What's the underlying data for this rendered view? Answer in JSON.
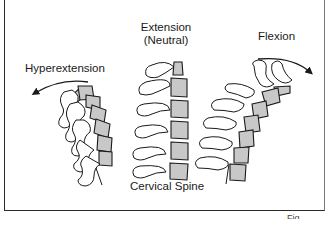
{
  "figure": {
    "title": "Cervical Spine",
    "panels": [
      {
        "id": "hyperextension",
        "label": "Hyperextension",
        "arrow_direction": "counter-clockwise (backward)"
      },
      {
        "id": "neutral",
        "label_line1": "Extension",
        "label_line2": "(Neutral)"
      },
      {
        "id": "flexion",
        "label": "Flexion",
        "arrow_direction": "clockwise (forward)"
      }
    ],
    "caption_cropped": "Fig."
  },
  "colors": {
    "vertebral_body_fill": "#c8c8c8",
    "line": "#1a1a1a",
    "background": "#ffffff"
  }
}
